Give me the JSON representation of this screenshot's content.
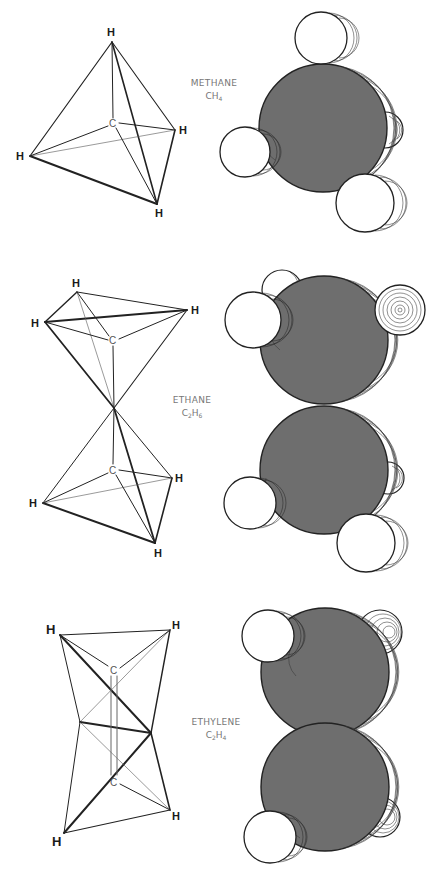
{
  "figure": {
    "colors": {
      "carbon_fill": "#6e6e6e",
      "hydrogen_fill": "#ffffff",
      "line": "#222222",
      "label_gray": "#777777"
    },
    "molecules": [
      {
        "id": "methane",
        "name": "METHANE",
        "formula": {
          "main": "CH",
          "sub": "4",
          "prefix": "",
          "prefix_sub": ""
        },
        "formula_text": "CH4",
        "ball_stick_labels": {
          "hydrogen": "H",
          "carbon": "C"
        },
        "atoms_in_tetrahedral_model": {
          "H": 4,
          "C": 1
        },
        "space_filling_atoms": {
          "C": 1,
          "H": 4
        }
      },
      {
        "id": "ethane",
        "name": "ETHANE",
        "formula": {
          "prefix": "C",
          "prefix_sub": "2",
          "main": "H",
          "sub": "6"
        },
        "formula_text": "C2H6",
        "ball_stick_labels": {
          "hydrogen": "H",
          "carbon": "C"
        },
        "atoms_in_tetrahedral_model": {
          "H": 6,
          "C": 2
        },
        "space_filling_atoms": {
          "C": 2,
          "H": 6
        }
      },
      {
        "id": "ethylene",
        "name": "ETHYLENE",
        "formula": {
          "prefix": "C",
          "prefix_sub": "2",
          "main": "H",
          "sub": "4"
        },
        "formula_text": "C2H4",
        "ball_stick_labels": {
          "hydrogen": "H",
          "carbon": "C"
        },
        "atoms_in_tetrahedral_model": {
          "H": 4,
          "C": 2
        },
        "space_filling_atoms": {
          "C": 2,
          "H": 4
        }
      }
    ],
    "labels": {
      "H": "H",
      "C": "C"
    }
  }
}
